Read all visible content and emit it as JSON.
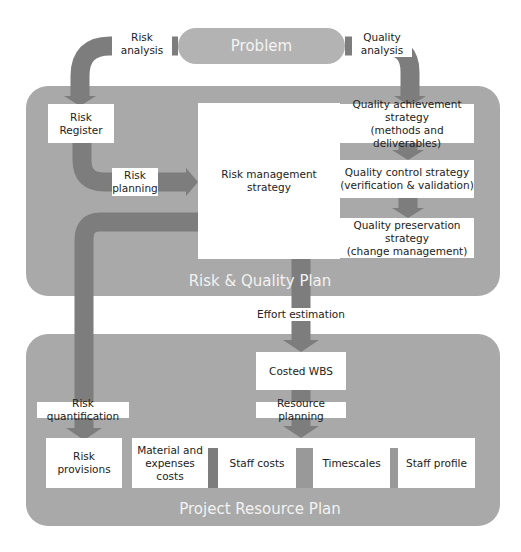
{
  "diagram": {
    "problem": {
      "label": "Problem"
    },
    "edges": {
      "risk_analysis": "Risk\nanalysis",
      "quality_analysis": "Quality\nanalysis",
      "risk_planning": "Risk\nplanning",
      "effort_estimation": "Effort estimation",
      "risk_quantification": "Risk quantification",
      "resource_planning": "Resource planning"
    },
    "risk_quality_plan": {
      "title": "Risk & Quality Plan",
      "risk_register": "Risk\nRegister",
      "risk_management_strategy": "Risk management strategy",
      "quality_achievement": "Quality achievement\nstrategy\n(methods and deliverables)",
      "quality_control": "Quality control strategy\n(verification & validation)",
      "quality_preservation": "Quality preservation\nstrategy\n(change management)"
    },
    "project_resource_plan": {
      "title": "Project Resource Plan",
      "costed_wbs": "Costed WBS",
      "risk_provisions": "Risk\nprovisions",
      "material_costs": "Material and\nexpenses costs",
      "staff_costs": "Staff costs",
      "timescales": "Timescales",
      "staff_profile": "Staff profile"
    },
    "colors": {
      "panel": "#a9a9a9",
      "pipe": "#7d7d7d",
      "pill": "#b3b3b3",
      "box": "#ffffff",
      "panel_title": "#f2f2f2"
    }
  }
}
